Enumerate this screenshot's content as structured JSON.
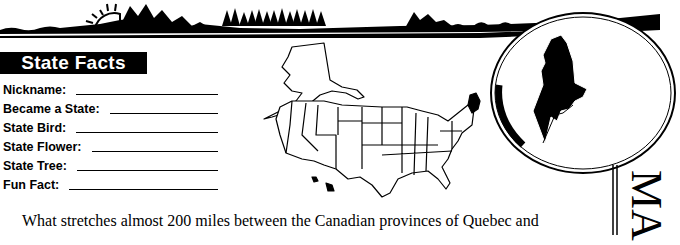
{
  "worksheet": {
    "section_title": "State Facts",
    "facts": [
      {
        "label": "Nickname:"
      },
      {
        "label": "Became a State:"
      },
      {
        "label": "State Bird:"
      },
      {
        "label": "State Flower:"
      },
      {
        "label": "State Tree:"
      },
      {
        "label": "Fun Fact:"
      }
    ],
    "paragraph_line_1": "What stretches almost 200 miles between the Canadian provinces of Quebec and",
    "paragraph_line_2": "",
    "state_name_vertical": "MA",
    "highlighted_state": "Maine"
  },
  "icons": {
    "banner": "landscape-banner-icon",
    "us_map": "us-map-icon",
    "state_silhouette": "maine-silhouette-icon"
  },
  "colors": {
    "ink": "#000000",
    "paper": "#ffffff"
  }
}
